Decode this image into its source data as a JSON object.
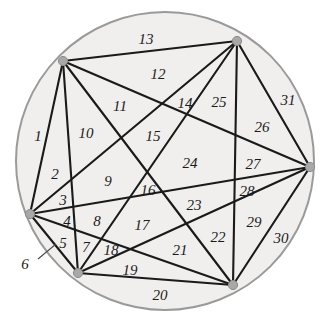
{
  "figure": {
    "type": "geometric-diagram",
    "canvas": {
      "width": 326,
      "height": 323
    },
    "colors": {
      "disk_fill": "#f0efed",
      "circle_stroke": "#9a9a9a",
      "chord_stroke": "#1a1a1a",
      "vertex_fill": "#a8a8a8",
      "vertex_stroke": "#8a8a8a",
      "label_color": "#1a1a1a",
      "background": "#ffffff"
    },
    "circle": {
      "cx": 165,
      "cy": 161,
      "r": 149,
      "stroke_width": 2
    },
    "vertex_count": 6,
    "region_count": 31,
    "chord_count": 15,
    "vertices": [
      {
        "name": "A",
        "x": 63,
        "y": 61
      },
      {
        "name": "B",
        "x": 237,
        "y": 41
      },
      {
        "name": "C",
        "x": 310,
        "y": 167
      },
      {
        "name": "D",
        "x": 233,
        "y": 285
      },
      {
        "name": "E",
        "x": 78,
        "y": 273
      },
      {
        "name": "F",
        "x": 30,
        "y": 214
      }
    ],
    "chords": [
      {
        "from": 0,
        "to": 1
      },
      {
        "from": 0,
        "to": 2
      },
      {
        "from": 0,
        "to": 3
      },
      {
        "from": 0,
        "to": 4
      },
      {
        "from": 0,
        "to": 5
      },
      {
        "from": 1,
        "to": 2
      },
      {
        "from": 1,
        "to": 3
      },
      {
        "from": 1,
        "to": 4
      },
      {
        "from": 1,
        "to": 5
      },
      {
        "from": 2,
        "to": 3
      },
      {
        "from": 2,
        "to": 4
      },
      {
        "from": 2,
        "to": 5
      },
      {
        "from": 3,
        "to": 4
      },
      {
        "from": 3,
        "to": 5
      },
      {
        "from": 4,
        "to": 5
      }
    ],
    "leader_line": {
      "x1": 38,
      "y1": 259,
      "x2": 56,
      "y2": 244
    },
    "region_labels": [
      {
        "text": "1",
        "x": 38,
        "y": 136
      },
      {
        "text": "2",
        "x": 55,
        "y": 174
      },
      {
        "text": "3",
        "x": 63,
        "y": 200
      },
      {
        "text": "4",
        "x": 67,
        "y": 221
      },
      {
        "text": "5",
        "x": 63,
        "y": 243
      },
      {
        "text": "6",
        "x": 25,
        "y": 264
      },
      {
        "text": "7",
        "x": 86,
        "y": 247
      },
      {
        "text": "8",
        "x": 97,
        "y": 221
      },
      {
        "text": "9",
        "x": 108,
        "y": 181
      },
      {
        "text": "10",
        "x": 86,
        "y": 133
      },
      {
        "text": "11",
        "x": 120,
        "y": 106
      },
      {
        "text": "12",
        "x": 158,
        "y": 74
      },
      {
        "text": "13",
        "x": 146,
        "y": 39
      },
      {
        "text": "14",
        "x": 185,
        "y": 103
      },
      {
        "text": "15",
        "x": 153,
        "y": 136
      },
      {
        "text": "16",
        "x": 148,
        "y": 190
      },
      {
        "text": "17",
        "x": 142,
        "y": 225
      },
      {
        "text": "18",
        "x": 111,
        "y": 250
      },
      {
        "text": "19",
        "x": 130,
        "y": 270
      },
      {
        "text": "20",
        "x": 160,
        "y": 295
      },
      {
        "text": "21",
        "x": 180,
        "y": 250
      },
      {
        "text": "22",
        "x": 218,
        "y": 237
      },
      {
        "text": "23",
        "x": 194,
        "y": 205
      },
      {
        "text": "24",
        "x": 190,
        "y": 163
      },
      {
        "text": "25",
        "x": 219,
        "y": 102
      },
      {
        "text": "26",
        "x": 262,
        "y": 127
      },
      {
        "text": "27",
        "x": 253,
        "y": 164
      },
      {
        "text": "28",
        "x": 247,
        "y": 191
      },
      {
        "text": "29",
        "x": 254,
        "y": 222
      },
      {
        "text": "30",
        "x": 281,
        "y": 238
      },
      {
        "text": "31",
        "x": 288,
        "y": 100
      }
    ]
  }
}
